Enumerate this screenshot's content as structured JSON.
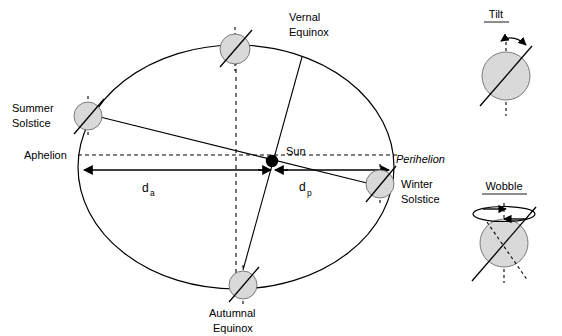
{
  "figure": {
    "background": "#ffffff",
    "ink": "#000000",
    "earth_fill": "#d9d9d9"
  },
  "orbit": {
    "center_label": "Sun",
    "positions": [
      {
        "key": "vernal_equinox",
        "label_line1": "Vernal",
        "label_line2": "Equinox"
      },
      {
        "key": "summer_solstice",
        "label_line1": "Summer",
        "label_line2": "Solstice"
      },
      {
        "key": "autumnal_equinox",
        "label_line1": "Autumnal",
        "label_line2": "Equinox"
      },
      {
        "key": "winter_solstice",
        "label_line1": "Winter",
        "label_line2": "Solstice"
      }
    ],
    "apsides": {
      "aphelion": "Aphelion",
      "perihelion": "Perihelion"
    },
    "distances": {
      "aphelion_symbol": "d",
      "aphelion_subscript": "a",
      "perihelion_symbol": "d",
      "perihelion_subscript": "p"
    }
  },
  "panels": [
    {
      "key": "tilt",
      "title": "Tilt"
    },
    {
      "key": "wobble",
      "title": "Wobble"
    }
  ]
}
